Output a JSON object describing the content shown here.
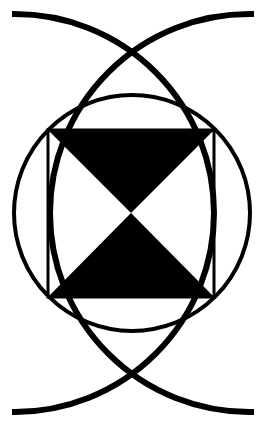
{
  "figure": {
    "title": "",
    "background": "#ffffff",
    "ink": "#000000",
    "elements": {
      "outer_arcs": [
        {
          "name": "left-centered-arc",
          "cx": 15,
          "cy": 213,
          "r": 199,
          "stroke_width": 6
        },
        {
          "name": "right-centered-arc",
          "cx": 249,
          "cy": 213,
          "r": 199,
          "stroke_width": 6
        }
      ],
      "circle": {
        "cx": 132,
        "cy": 213,
        "r": 118,
        "stroke_width": 4
      },
      "square": {
        "x": 48,
        "y": 130,
        "width": 166,
        "height": 167,
        "stroke_width": 3
      },
      "hourglass": {
        "top_triangle": [
          [
            48,
            130
          ],
          [
            214,
            130
          ],
          [
            131,
            213
          ]
        ],
        "bottom_triangle": [
          [
            48,
            297
          ],
          [
            214,
            297
          ],
          [
            131,
            213
          ]
        ]
      }
    }
  }
}
